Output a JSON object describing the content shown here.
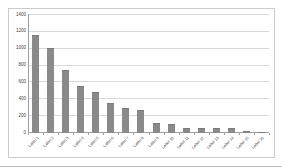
{
  "page": {
    "background_color": "#ffffff",
    "bottom_rule_color": "#bdbdbd"
  },
  "chart": {
    "frame_border_color": "#cbcbcb",
    "plot_background": "#ffffff"
  },
  "chart_data": {
    "type": "bar",
    "title": "",
    "legend": "none",
    "grid": "horizontal",
    "categories": [
      "Label 1",
      "Label 2",
      "Label 3",
      "Label 4",
      "Label 5",
      "Label 6",
      "Label 7",
      "Label 8",
      "Label 9",
      "Label 10",
      "Label 11",
      "Label 12",
      "Label 13",
      "Label 14",
      "Label 15",
      "Label 16"
    ],
    "categories_note": "x-axis tick labels are rotated 45 degrees and illegible at source resolution; placeholder names used",
    "values": [
      1150,
      1000,
      730,
      550,
      480,
      350,
      290,
      265,
      110,
      90,
      45,
      45,
      45,
      45,
      10,
      5
    ],
    "xlabel": "",
    "ylabel": "",
    "ylim": [
      0,
      1400
    ],
    "ytick_step": 200,
    "yticks": [
      "0",
      "200",
      "400",
      "600",
      "800",
      "1000",
      "1200",
      "1400"
    ],
    "bar_color": "#8a8a8a",
    "bar_edge_color": "#7b7b7b",
    "gridline_color": "#d9d9d9",
    "axis_color": "#a0a0a0",
    "tick_label_color": "#3f3f3f"
  }
}
